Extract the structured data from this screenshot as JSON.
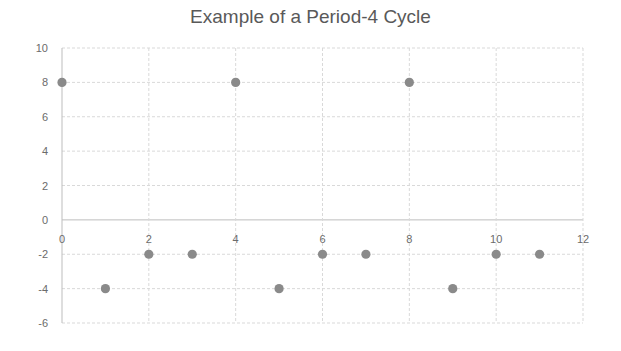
{
  "chart_data": {
    "type": "scatter",
    "title": "Example of a Period-4 Cycle",
    "xlabel": "",
    "ylabel": "",
    "xlim": [
      0,
      12
    ],
    "ylim": [
      -6,
      10
    ],
    "x_ticks": [
      0,
      2,
      4,
      6,
      8,
      10,
      12
    ],
    "y_ticks": [
      10,
      8,
      6,
      4,
      2,
      0,
      -2,
      -4,
      -6
    ],
    "grid": true,
    "legend": null,
    "series": [
      {
        "name": "Series 1",
        "color": "#8a8a8a",
        "x": [
          0,
          1,
          2,
          3,
          4,
          5,
          6,
          7,
          8,
          9,
          10,
          11
        ],
        "y": [
          8,
          -4,
          -2,
          -2,
          8,
          -4,
          -2,
          -2,
          8,
          -4,
          -2,
          -2
        ]
      }
    ]
  }
}
